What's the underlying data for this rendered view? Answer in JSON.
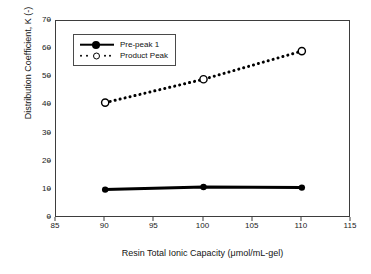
{
  "chart_data": {
    "type": "line",
    "title": "",
    "xlabel": "Resin Total Ionic Capacity (μmol/mL-gel)",
    "ylabel": "Distribution Coefficient, K (-)",
    "xlim": [
      85,
      115
    ],
    "ylim": [
      0,
      70
    ],
    "xticks": [
      85,
      90,
      95,
      100,
      105,
      110,
      115
    ],
    "yticks": [
      0,
      10,
      20,
      30,
      40,
      50,
      60,
      70
    ],
    "xtick_labels": [
      "85",
      "90",
      "95",
      "100",
      "105",
      "110",
      "115"
    ],
    "ytick_labels": [
      "0",
      "10",
      "20",
      "30",
      "40",
      "50",
      "60",
      "70"
    ],
    "grid": false,
    "legend_position": "upper left inside",
    "x": [
      90,
      100,
      110
    ],
    "series": [
      {
        "name": "Pre-peak 1",
        "values": [
          10.1,
          11.0,
          10.8
        ],
        "line_style": "solid",
        "line_width": 3,
        "marker": "filled-circle",
        "color": "#000000"
      },
      {
        "name": "Product Peak",
        "values": [
          41.0,
          49.3,
          59.3
        ],
        "line_style": "dotted",
        "line_width": 3,
        "marker": "open-circle",
        "color": "#000000"
      }
    ]
  },
  "legend": {
    "items": [
      {
        "label": "Pre-peak 1",
        "key": "solid-line-filled-circle"
      },
      {
        "label": "Product Peak",
        "key": "dotted-line-open-circle"
      }
    ]
  },
  "colors": {
    "foreground": "#000000",
    "axis": "#3d3d3d",
    "background": "#ffffff"
  }
}
